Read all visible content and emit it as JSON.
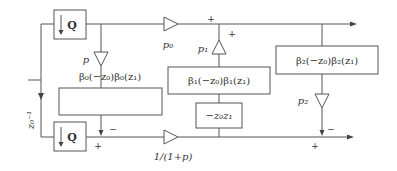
{
  "diagram": {
    "type": "signal-flow block diagram",
    "blocks": {
      "q_top": "Q",
      "q_bottom": "Q",
      "beta0": "β₀(−z₀)β₀(z₁)",
      "beta1": "β₁(−z₀)β₁(z₁)",
      "beta2": "β₂(−z₀)β₂(z₁)",
      "z0z1": "−z₀z₁"
    },
    "gains": {
      "p": "p",
      "p0": "p₀",
      "p1": "p₁",
      "p2": "p₂",
      "inv": "1/(1+p)"
    },
    "delay": "z₀⁻¹",
    "signs": {
      "top_junction_left": "+",
      "top_junction_right": "+",
      "bottom_left_plus": "+",
      "bottom_left_minus": "−",
      "bottom_right_plus": "+",
      "bottom_right_minus": "−"
    },
    "colors": {
      "line": "#555555",
      "text": "#333333"
    }
  }
}
